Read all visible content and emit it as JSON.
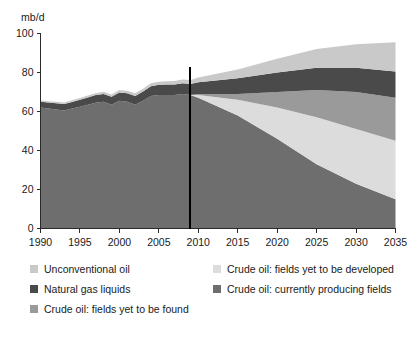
{
  "axes": {
    "y_unit_label": "mb/d",
    "y_ticks": [
      0,
      20,
      40,
      60,
      80,
      100
    ],
    "x_ticks": [
      1990,
      1995,
      2000,
      2005,
      2010,
      2015,
      2020,
      2025,
      2030,
      2035
    ]
  },
  "legend": {
    "items": [
      {
        "label": "Unconventional oil",
        "color": "#c9c9c9",
        "col": 1,
        "row": 1
      },
      {
        "label": "Natural gas liquids",
        "color": "#4a4a4a",
        "col": 1,
        "row": 2
      },
      {
        "label": "Crude oil: fields yet to be found",
        "color": "#9a9a9a",
        "col": 1,
        "row": 3
      },
      {
        "label": "Crude oil: fields yet to be developed",
        "color": "#dcdcdc",
        "col": 2,
        "row": 1
      },
      {
        "label": "Crude oil: currently producing fields",
        "color": "#6e6e6e",
        "col": 2,
        "row": 2
      }
    ]
  },
  "chart_data": {
    "type": "area",
    "title": "",
    "subtitle": "",
    "xlabel": "",
    "ylabel": "mb/d",
    "y_unit": "mb/d",
    "xlim": [
      1990,
      2035
    ],
    "ylim": [
      0,
      100
    ],
    "grid": false,
    "legend_position": "bottom",
    "stacked": true,
    "divider_year": 2009,
    "divider_note": "vertical black line separating historical data from projection",
    "x": [
      1990,
      1991,
      1992,
      1993,
      1994,
      1995,
      1996,
      1997,
      1998,
      1999,
      2000,
      2001,
      2002,
      2003,
      2004,
      2005,
      2006,
      2007,
      2008,
      2009,
      2010,
      2015,
      2020,
      2025,
      2030,
      2035
    ],
    "series": [
      {
        "name": "Crude oil: currently producing fields",
        "color": "#6e6e6e",
        "values": [
          62.0,
          61.5,
          61.0,
          60.5,
          61.5,
          62.5,
          63.5,
          64.5,
          65.0,
          63.5,
          65.5,
          65.0,
          63.5,
          65.5,
          68.0,
          68.5,
          68.5,
          68.5,
          69.0,
          68.5,
          67.0,
          58.0,
          46.0,
          33.0,
          23.0,
          15.0
        ]
      },
      {
        "name": "Crude oil: fields yet to be developed",
        "color": "#dcdcdc",
        "values": [
          0,
          0,
          0,
          0,
          0,
          0,
          0,
          0,
          0,
          0,
          0,
          0,
          0,
          0,
          0,
          0,
          0,
          0,
          0,
          0,
          1.5,
          8.0,
          16.0,
          24.0,
          28.0,
          30.0
        ]
      },
      {
        "name": "Crude oil: fields yet to be found",
        "color": "#9a9a9a",
        "values": [
          0,
          0,
          0,
          0,
          0,
          0,
          0,
          0,
          0,
          0,
          0,
          0,
          0,
          0,
          0,
          0,
          0,
          0,
          0,
          0,
          0.5,
          3.0,
          8.0,
          14.0,
          19.0,
          22.0
        ]
      },
      {
        "name": "Natural gas liquids",
        "color": "#4a4a4a",
        "values": [
          3.0,
          3.1,
          3.2,
          3.3,
          3.4,
          3.5,
          3.7,
          3.9,
          4.0,
          4.1,
          4.3,
          4.4,
          4.5,
          4.8,
          5.0,
          5.2,
          5.3,
          5.4,
          5.5,
          5.6,
          6.0,
          8.0,
          10.0,
          11.5,
          12.5,
          13.5
        ]
      },
      {
        "name": "Unconventional oil",
        "color": "#c9c9c9",
        "values": [
          0.7,
          0.7,
          0.8,
          0.8,
          0.9,
          0.9,
          1.0,
          1.0,
          1.1,
          1.1,
          1.2,
          1.3,
          1.3,
          1.4,
          1.5,
          1.6,
          1.7,
          1.8,
          1.9,
          2.0,
          2.5,
          4.5,
          7.0,
          9.5,
          12.0,
          15.0
        ]
      }
    ],
    "totals": [
      65.7,
      65.3,
      65.0,
      64.6,
      65.8,
      66.9,
      68.2,
      69.4,
      70.1,
      68.7,
      71.0,
      70.7,
      69.3,
      71.7,
      74.5,
      75.3,
      75.5,
      75.7,
      76.4,
      76.1,
      77.5,
      81.5,
      87.0,
      92.0,
      94.5,
      95.5
    ]
  }
}
